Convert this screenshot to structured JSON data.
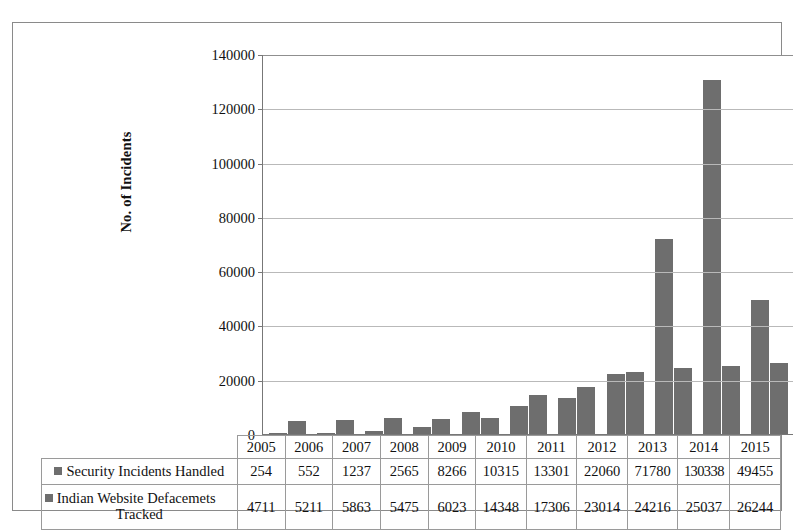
{
  "figure": {
    "top_cut_caption": "",
    "y_axis_title": "No. of Incidents"
  },
  "legend": {
    "swatch_color": "#6e6e6e",
    "entries": [
      {
        "label": "Security Incidents Handled"
      },
      {
        "label": "Indian Website Defacemets Tracked"
      }
    ]
  },
  "table": {
    "row_label_col_header": "",
    "year_header": [
      "2005",
      "2006",
      "2007",
      "2008",
      "2009",
      "2010",
      "2011",
      "2012",
      "2013",
      "2014",
      "2015"
    ],
    "rows": [
      {
        "label_line1": "Security Incidents Handled",
        "label_line2": "",
        "values": [
          "254",
          "552",
          "1237",
          "2565",
          "8266",
          "10315",
          "13301",
          "22060",
          "71780",
          "130338",
          "49455"
        ]
      },
      {
        "label_line1": "Indian Website Defacemets",
        "label_line2": "Tracked",
        "values": [
          "4711",
          "5211",
          "5863",
          "5475",
          "6023",
          "14348",
          "17306",
          "23014",
          "24216",
          "25037",
          "26244"
        ]
      }
    ]
  },
  "chart_data": {
    "type": "bar",
    "title": "",
    "xlabel": "",
    "ylabel": "No. of Incidents",
    "categories": [
      "2005",
      "2006",
      "2007",
      "2008",
      "2009",
      "2010",
      "2011",
      "2012",
      "2013",
      "2014",
      "2015"
    ],
    "series": [
      {
        "name": "Security Incidents Handled",
        "color": "#6e6e6e",
        "values": [
          254,
          552,
          1237,
          2565,
          8266,
          10315,
          13301,
          22060,
          71780,
          130338,
          49455
        ]
      },
      {
        "name": "Indian Website Defacemets Tracked",
        "color": "#6e6e6e",
        "values": [
          4711,
          5211,
          5863,
          5475,
          6023,
          14348,
          17306,
          23014,
          24216,
          25037,
          26244
        ]
      }
    ],
    "ylim": [
      0,
      140000
    ],
    "yticks": [
      0,
      20000,
      40000,
      60000,
      80000,
      100000,
      120000,
      140000
    ],
    "ytick_labels": [
      "0",
      "20000",
      "40000",
      "60000",
      "80000",
      "100000",
      "120000",
      "140000"
    ],
    "grid": true,
    "grid_axis": "y",
    "legend_position": "data-table-below"
  }
}
